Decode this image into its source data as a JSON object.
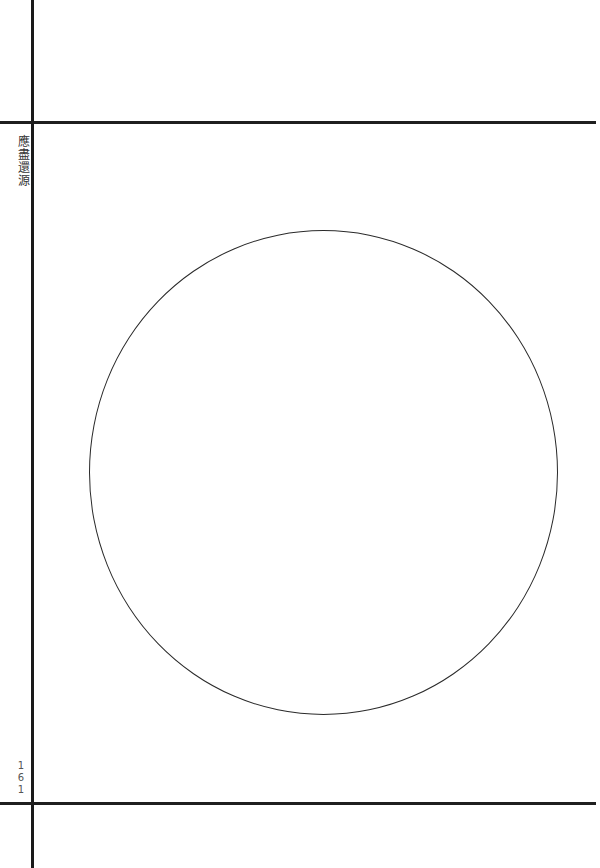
{
  "page": {
    "title_vertical": "應盡還源",
    "page_number_digits": [
      "1",
      "6",
      "1"
    ],
    "figure": "ensō circle"
  },
  "colors": {
    "ink": "#1f1f1f",
    "paper": "#ffffff"
  }
}
